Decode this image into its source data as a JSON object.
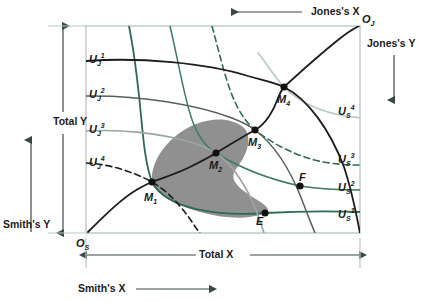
{
  "figure": {
    "type": "edgeworth-box",
    "axes": {
      "top_label": "Jones's X",
      "right_label": "Jones's Y",
      "left_label": "Smith's Y",
      "bottom_label": "Smith's X",
      "total_x_label": "Total X",
      "total_y_label": "Total Y"
    },
    "origins": {
      "smith": {
        "base": "O",
        "sub": "S"
      },
      "jones": {
        "base": "O",
        "sub": "J"
      }
    },
    "jones_curves": [
      {
        "base": "U",
        "sub": "J",
        "sup": "1",
        "color": "#1c1c1c",
        "dashed": false
      },
      {
        "base": "U",
        "sub": "J",
        "sup": "2",
        "color": "#555f5c",
        "dashed": false
      },
      {
        "base": "U",
        "sub": "J",
        "sup": "3",
        "color": "#9aa7a3",
        "dashed": false
      },
      {
        "base": "U",
        "sub": "J",
        "sup": "4",
        "color": "#1c1c1c",
        "dashed": true
      }
    ],
    "smith_curves": [
      {
        "base": "U",
        "sub": "S",
        "sup": "1",
        "color": "#2f6b52",
        "dashed": false
      },
      {
        "base": "U",
        "sub": "S",
        "sup": "2",
        "color": "#3d7a60",
        "dashed": false
      },
      {
        "base": "U",
        "sub": "S",
        "sup": "3",
        "color": "#2f6b52",
        "dashed": true
      },
      {
        "base": "U",
        "sub": "S",
        "sup": "4",
        "color": "#b9c9c3",
        "dashed": false
      }
    ],
    "points": [
      {
        "base": "M",
        "sub": "1",
        "x": 152,
        "y": 182
      },
      {
        "base": "M",
        "sub": "2",
        "x": 216,
        "y": 153
      },
      {
        "base": "M",
        "sub": "3",
        "x": 255,
        "y": 130
      },
      {
        "base": "M",
        "sub": "4",
        "x": 284,
        "y": 87
      },
      {
        "base": "E",
        "sub": "",
        "x": 265,
        "y": 213
      },
      {
        "base": "F",
        "sub": "",
        "x": 300,
        "y": 186
      }
    ],
    "colors": {
      "box_border": "#b7c9c4",
      "smith_green": "#2f6b52",
      "jones_black": "#1c1c1c",
      "shaded_lens": "#8a8a8a",
      "axis_gray": "#6d7a77"
    }
  }
}
